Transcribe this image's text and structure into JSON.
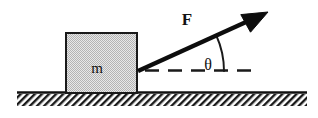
{
  "diagram": {
    "type": "free-body-diagram",
    "canvas": {
      "width": 318,
      "height": 118,
      "background": "#ffffff"
    },
    "labels": {
      "force": "F",
      "mass": "m",
      "angle": "θ"
    },
    "colors": {
      "ink": "#111111",
      "block_fill": "#d2d2d2",
      "block_stroke": "#1a1a1a",
      "ground_stroke": "#111111",
      "hatch": "#1a1a1a",
      "arrow": "#0d0d0d",
      "dash": "#1a1a1a",
      "arc": "#1a1a1a"
    },
    "block": {
      "name": "mass-block",
      "x": 66,
      "y": 33,
      "width": 71,
      "height": 60,
      "fill_pattern": "fine-checker-dither",
      "label": "m",
      "label_x": 97,
      "label_y": 73
    },
    "ground": {
      "name": "ground-surface",
      "line_y": 93,
      "x_start": 17,
      "x_end": 307,
      "hatch_depth": 12,
      "hatch_angle_deg": 45,
      "hatch_spacing": 5
    },
    "force_vector": {
      "name": "force-arrow",
      "tail_x": 138,
      "tail_y": 71,
      "tip_x": 268,
      "tip_y": 12,
      "shaft_width": 4,
      "head_length": 20,
      "head_half_width": 9,
      "label": "F",
      "label_x": 187,
      "label_y": 25
    },
    "reference_line": {
      "name": "horizontal-reference-dashed",
      "y": 71,
      "x_start": 145,
      "x_end": 257,
      "dash_pattern": "14 9"
    },
    "angle_arc": {
      "name": "angle-arc",
      "center_x": 138,
      "center_y": 71,
      "radius": 86,
      "start_deg": 0,
      "end_deg": 24.4,
      "label": "θ",
      "label_x": 208,
      "label_y": 70
    }
  }
}
